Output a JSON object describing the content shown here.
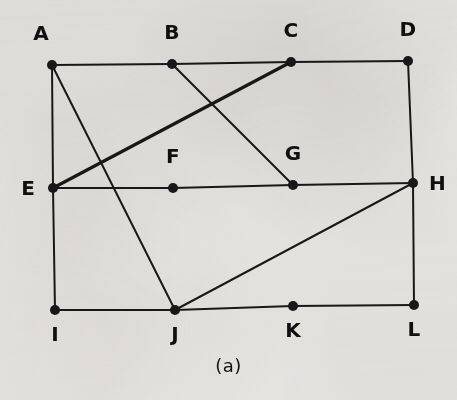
{
  "figure": {
    "caption": "(a)",
    "background_color": "#f1f0ee",
    "ink_color": "#1a1a1a",
    "node_radius": 5,
    "edge_width_thin": 2.0,
    "edge_width_thick": 3.2
  },
  "chart_data": {
    "type": "diagram",
    "title": "(a)",
    "nodes": [
      {
        "id": "A",
        "label": "A",
        "x": 52,
        "y": 65,
        "row": 0,
        "col": 0,
        "label_pos": "above-left"
      },
      {
        "id": "B",
        "label": "B",
        "x": 172,
        "y": 64,
        "row": 0,
        "col": 1,
        "label_pos": "above"
      },
      {
        "id": "C",
        "label": "C",
        "x": 291,
        "y": 62,
        "row": 0,
        "col": 2,
        "label_pos": "above"
      },
      {
        "id": "D",
        "label": "D",
        "x": 408,
        "y": 61,
        "row": 0,
        "col": 3,
        "label_pos": "above"
      },
      {
        "id": "E",
        "label": "E",
        "x": 53,
        "y": 188,
        "row": 1,
        "col": 0,
        "label_pos": "left"
      },
      {
        "id": "F",
        "label": "F",
        "x": 173,
        "y": 188,
        "row": 1,
        "col": 1,
        "label_pos": "above"
      },
      {
        "id": "G",
        "label": "G",
        "x": 293,
        "y": 185,
        "row": 1,
        "col": 2,
        "label_pos": "above"
      },
      {
        "id": "H",
        "label": "H",
        "x": 413,
        "y": 183,
        "row": 1,
        "col": 3,
        "label_pos": "right"
      },
      {
        "id": "I",
        "label": "I",
        "x": 55,
        "y": 310,
        "row": 2,
        "col": 0,
        "label_pos": "below"
      },
      {
        "id": "J",
        "label": "J",
        "x": 175,
        "y": 310,
        "row": 2,
        "col": 1,
        "label_pos": "below"
      },
      {
        "id": "K",
        "label": "K",
        "x": 293,
        "y": 306,
        "row": 2,
        "col": 2,
        "label_pos": "below"
      },
      {
        "id": "L",
        "label": "L",
        "x": 414,
        "y": 305,
        "row": 2,
        "col": 3,
        "label_pos": "below"
      }
    ],
    "edges": [
      {
        "from": "A",
        "to": "B",
        "kind": "top-row",
        "weight": "thin"
      },
      {
        "from": "B",
        "to": "C",
        "kind": "top-row",
        "weight": "thin"
      },
      {
        "from": "C",
        "to": "D",
        "kind": "top-row",
        "weight": "thin"
      },
      {
        "from": "A",
        "to": "E",
        "kind": "left-side",
        "weight": "thin"
      },
      {
        "from": "E",
        "to": "I",
        "kind": "left-side",
        "weight": "thin"
      },
      {
        "from": "D",
        "to": "H",
        "kind": "right-side",
        "weight": "thin"
      },
      {
        "from": "H",
        "to": "L",
        "kind": "right-side",
        "weight": "thin"
      },
      {
        "from": "E",
        "to": "F",
        "kind": "middle-row",
        "weight": "thin"
      },
      {
        "from": "F",
        "to": "G",
        "kind": "middle-row",
        "weight": "thin"
      },
      {
        "from": "G",
        "to": "H",
        "kind": "middle-row",
        "weight": "thin"
      },
      {
        "from": "I",
        "to": "J",
        "kind": "bottom-row",
        "weight": "thin"
      },
      {
        "from": "J",
        "to": "K",
        "kind": "bottom-row",
        "weight": "thin"
      },
      {
        "from": "K",
        "to": "L",
        "kind": "bottom-row",
        "weight": "thin"
      },
      {
        "from": "E",
        "to": "C",
        "kind": "diagonal",
        "weight": "thick"
      },
      {
        "from": "B",
        "to": "G",
        "kind": "diagonal",
        "weight": "thin"
      },
      {
        "from": "A",
        "to": "J",
        "kind": "diagonal",
        "weight": "thin"
      },
      {
        "from": "J",
        "to": "H",
        "kind": "diagonal",
        "weight": "thin"
      }
    ],
    "node_count": 12,
    "edge_count": 17
  }
}
